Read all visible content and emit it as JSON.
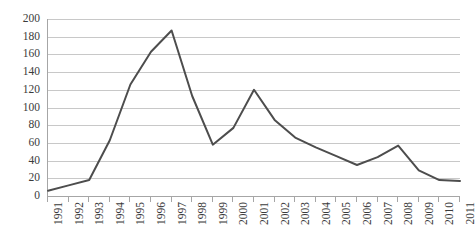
{
  "chart_data": {
    "type": "line",
    "title": "",
    "subtitle": "",
    "xlabel": "",
    "ylabel": "",
    "categories": [
      "1991",
      "1992",
      "1993",
      "1994",
      "1995",
      "1996",
      "1997",
      "1998",
      "1999",
      "2000",
      "2001",
      "2002",
      "2003",
      "2004",
      "2005",
      "2006",
      "2007",
      "2008",
      "2009",
      "2010",
      "2011"
    ],
    "values": [
      6,
      12,
      18,
      63,
      126,
      163,
      187,
      113,
      58,
      77,
      120,
      86,
      66,
      55,
      45,
      35,
      44,
      57,
      29,
      18,
      17
    ],
    "series": [
      {
        "name": "Series 1",
        "values": [
          6,
          12,
          18,
          63,
          126,
          163,
          187,
          113,
          58,
          77,
          120,
          86,
          66,
          55,
          45,
          35,
          44,
          57,
          29,
          18,
          17
        ]
      }
    ],
    "ylim": [
      0,
      200
    ],
    "y_ticks": [
      0,
      20,
      40,
      60,
      80,
      100,
      120,
      140,
      160,
      180,
      200
    ],
    "y_tick_labels": [
      "0",
      "20",
      "40",
      "60",
      "80",
      "100",
      "120",
      "140",
      "160",
      "180",
      "200"
    ],
    "grid": true,
    "grid_axis": "y",
    "legend": false,
    "legend_position": "none",
    "markers": false,
    "annotations": []
  },
  "style": {
    "line_color": "#4d4d4d",
    "grid_color": "#c8c8c8",
    "axis_color": "#a6a6a6",
    "text_color": "#3b3b3b",
    "background": "#ffffff"
  }
}
